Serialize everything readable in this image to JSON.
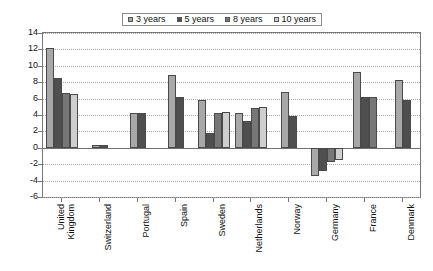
{
  "chart": {
    "type": "bar",
    "title": "",
    "xlabel": "",
    "ylabel": "",
    "grid": true,
    "legend_position": "top-center",
    "ylim": [
      -6,
      14
    ],
    "ytick_step": 2
  },
  "legend": {
    "entries": [
      {
        "label": "3 years",
        "color": "#a8a8a8",
        "icon": "legend-swatch-icon"
      },
      {
        "label": "5 years",
        "color": "#4f4f4f",
        "icon": "legend-swatch-icon"
      },
      {
        "label": "8 years",
        "color": "#777777",
        "icon": "legend-swatch-icon"
      },
      {
        "label": "10 years",
        "color": "#cfcfcf",
        "icon": "legend-swatch-icon"
      }
    ]
  },
  "yaxis": {
    "ticks": [
      "14",
      "12",
      "10",
      "8",
      "6",
      "4",
      "2",
      "0",
      "-2",
      "-4",
      "-6"
    ],
    "values": [
      14,
      12,
      10,
      8,
      6,
      4,
      2,
      0,
      -2,
      -4,
      -6
    ]
  },
  "chart_data": {
    "type": "bar",
    "title": "",
    "xlabel": "",
    "ylabel": "",
    "ylim": [
      -6,
      14
    ],
    "ytick_step": 2,
    "grid": true,
    "legend_position": "top-center",
    "categories": [
      "United Kingdom",
      "Switzerland",
      "Portugal",
      "Spain",
      "Sweden",
      "Netherlands",
      "Norway",
      "Germany",
      "France",
      "Denmark"
    ],
    "series": [
      {
        "name": "3 years",
        "color": "#a8a8a8",
        "values": [
          12.2,
          0.4,
          4.2,
          8.9,
          5.8,
          4.2,
          6.8,
          -3.4,
          9.2,
          8.3
        ]
      },
      {
        "name": "5 years",
        "color": "#4f4f4f",
        "values": [
          8.5,
          0.4,
          4.2,
          6.2,
          1.8,
          3.3,
          3.9,
          -2.8,
          6.2,
          5.8
        ]
      },
      {
        "name": "8 years",
        "color": "#777777",
        "values": [
          6.7,
          null,
          null,
          null,
          4.2,
          4.8,
          null,
          -1.7,
          6.2,
          null
        ]
      },
      {
        "name": "10 years",
        "color": "#cfcfcf",
        "values": [
          6.6,
          null,
          null,
          null,
          4.4,
          5.0,
          null,
          -1.5,
          null,
          null
        ]
      }
    ]
  }
}
